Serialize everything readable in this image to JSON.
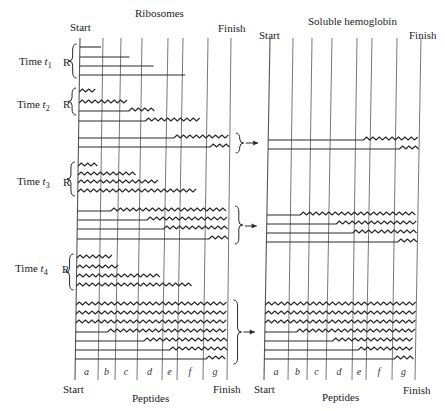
{
  "left_panel": {
    "title": "Ribosomes",
    "start_label": "Start",
    "finish_label": "Finish",
    "bottom_start_label": "Start",
    "bottom_finish_label": "Finish",
    "bottom_title": "Peptides",
    "x_top": [
      80,
      103,
      121,
      142,
      168,
      183,
      208,
      231
    ],
    "x_bottom": [
      75,
      98,
      115,
      137,
      162,
      177,
      203,
      227
    ],
    "y_top": 38,
    "y_bottom": 380
  },
  "right_panel": {
    "title": "Soluble hemoglobin",
    "start_label": "Start",
    "finish_label": "Finish",
    "bottom_start_label": "Start",
    "bottom_finish_label": "Finish",
    "bottom_title": "Peptides",
    "x_top": [
      270,
      293,
      312,
      332,
      357,
      372,
      397,
      421
    ],
    "x_bottom": [
      264,
      288,
      307,
      326,
      352,
      366,
      392,
      415
    ],
    "y_top": 38,
    "y_bottom": 380
  },
  "segment_labels": [
    "a",
    "b",
    "c",
    "d",
    "e",
    "f",
    "g"
  ],
  "time_points": [
    {
      "label": "Time",
      "sub": "1",
      "r_label": "R",
      "y": 63
    },
    {
      "label": "Time",
      "sub": "2",
      "r_label": "R",
      "y": 106
    },
    {
      "label": "Time",
      "sub": "3",
      "r_label": "R",
      "y": 183
    },
    {
      "label": "Time",
      "sub": "4",
      "r_label": "R",
      "y": 270
    }
  ],
  "ribosome_chains": [
    {
      "y": 47,
      "straight_to": 0,
      "end": 0.14
    },
    {
      "y": 57,
      "straight_to": 0,
      "end": 0.33
    },
    {
      "y": 66,
      "straight_to": 0,
      "end": 0.49
    },
    {
      "y": 75,
      "straight_to": 0,
      "end": 0.7,
      "flat": true
    },
    {
      "y": 92,
      "straight_to": 0,
      "wave_end": 0.12
    },
    {
      "y": 103,
      "straight_to": 0,
      "wave_end": 0.32
    },
    {
      "y": 111,
      "straight_to": 0.33,
      "wave_end": 0.5
    },
    {
      "y": 121,
      "straight_to": 0.44,
      "wave_end": 0.81
    },
    {
      "y": 138,
      "straight_to": 0.63,
      "wave_end": 1.0
    },
    {
      "y": 147,
      "straight_to": 0.87,
      "wave_end": 1.0
    },
    {
      "y": 166,
      "straight_to": 0,
      "wave_end": 0.14
    },
    {
      "y": 175,
      "straight_to": 0,
      "wave_end": 0.38
    },
    {
      "y": 183,
      "straight_to": 0,
      "wave_end": 0.53
    },
    {
      "y": 192,
      "straight_to": 0,
      "wave_end": 0.8
    },
    {
      "y": 211,
      "straight_to": 0.22,
      "wave_end": 1.0
    },
    {
      "y": 220,
      "straight_to": 0.46,
      "wave_end": 1.0
    },
    {
      "y": 229,
      "straight_to": 0.57,
      "wave_end": 1.0
    },
    {
      "y": 239,
      "straight_to": 0.87,
      "wave_end": 1.0
    },
    {
      "y": 258,
      "straight_to": 0,
      "wave_end": 0.24
    },
    {
      "y": 268,
      "straight_to": 0,
      "wave_end": 0.29
    },
    {
      "y": 277,
      "straight_to": 0,
      "wave_end": 0.55
    },
    {
      "y": 286,
      "straight_to": 0,
      "wave_end": 0.77
    },
    {
      "y": 305,
      "straight_to": 0,
      "wave_end": 1.0
    },
    {
      "y": 314,
      "straight_to": 0,
      "wave_end": 1.0
    },
    {
      "y": 323,
      "straight_to": 0,
      "wave_end": 1.0
    },
    {
      "y": 332,
      "straight_to": 0.21,
      "wave_end": 1.0
    },
    {
      "y": 341,
      "straight_to": 0.45,
      "wave_end": 1.0
    },
    {
      "y": 350,
      "straight_to": 0.62,
      "wave_end": 1.0
    },
    {
      "y": 359,
      "straight_to": 0.86,
      "wave_end": 1.0
    }
  ],
  "hemoglobin_chains": [
    {
      "y": 140,
      "straight_to": 0.63,
      "wave_end": 1.0
    },
    {
      "y": 149,
      "straight_to": 0.87,
      "wave_end": 1.0
    },
    {
      "y": 215,
      "straight_to": 0.22,
      "wave_end": 1.0
    },
    {
      "y": 224,
      "straight_to": 0.46,
      "wave_end": 1.0
    },
    {
      "y": 233,
      "straight_to": 0.57,
      "wave_end": 1.0
    },
    {
      "y": 242,
      "straight_to": 0.87,
      "wave_end": 1.0
    },
    {
      "y": 305,
      "straight_to": 0,
      "wave_end": 1.0
    },
    {
      "y": 314,
      "straight_to": 0,
      "wave_end": 1.0
    },
    {
      "y": 323,
      "straight_to": 0,
      "wave_end": 1.0
    },
    {
      "y": 332,
      "straight_to": 0.21,
      "wave_end": 1.0
    },
    {
      "y": 341,
      "straight_to": 0.45,
      "wave_end": 1.0
    },
    {
      "y": 350,
      "straight_to": 0.62,
      "wave_end": 1.0
    },
    {
      "y": 359,
      "straight_to": 0.86,
      "wave_end": 1.0
    }
  ],
  "groups": [
    {
      "r_brace": [
        44,
        78
      ],
      "soluble_brace": [
        133,
        153
      ],
      "arrow_y": 143
    },
    {
      "r_brace": [
        88,
        115
      ]
    },
    {
      "r_brace": [
        162,
        196
      ],
      "soluble_brace": [
        206,
        244
      ],
      "arrow_y": 226
    },
    {
      "r_brace": [
        254,
        290
      ],
      "soluble_brace": [
        300,
        364
      ],
      "arrow_y": 332
    }
  ]
}
